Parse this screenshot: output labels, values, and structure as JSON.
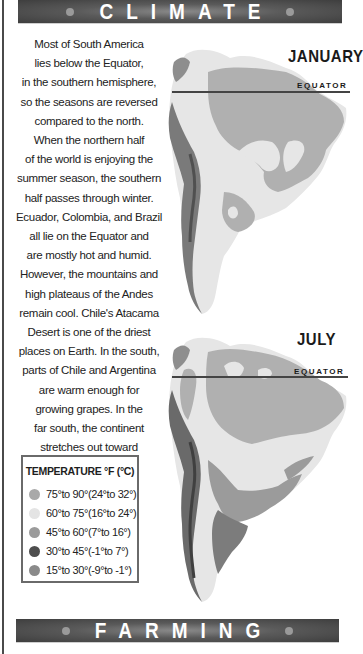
{
  "header": {
    "title": "CLIMATE"
  },
  "footer": {
    "title": "FARMING"
  },
  "body_text": {
    "lines": [
      "Most of South America",
      "lies below the Equator,",
      "in the southern hemisphere,",
      "so the seasons are reversed",
      "compared to the north.",
      "When the northern half",
      "of the world is enjoying the",
      "summer season, the southern",
      "half passes through winter.",
      "Ecuador, Colombia, and Brazil",
      "all lie on the Equator and",
      "are mostly hot and humid.",
      "However, the mountains and",
      "high plateaus of the Andes",
      "remain cool. Chile's Atacama",
      "Desert is one of the driest",
      "places on Earth. In the south,",
      "parts of Chile and Argentina",
      "are warm enough for",
      "growing grapes. In the",
      "far south, the continent",
      "stretches out toward",
      "Antarctica."
    ]
  },
  "legend": {
    "title": "TEMPERATURE °F (°C)",
    "items": [
      {
        "label": "75°to 90°(24°to 32°)",
        "color": "#a9a9a9"
      },
      {
        "label": "60°to 75°(16°to 24°)",
        "color": "#e4e4e4"
      },
      {
        "label": "45°to 60°(7°to 16°)",
        "color": "#9b9b9b"
      },
      {
        "label": "30°to 45°(-1°to 7°)",
        "color": "#4e4e4e"
      },
      {
        "label": "15°to 30°(-9°to -1°)",
        "color": "#8a8a8a"
      }
    ]
  },
  "maps": [
    {
      "month": "JANUARY",
      "equator_label": "EQUATOR"
    },
    {
      "month": "JULY",
      "equator_label": "EQUATOR"
    }
  ],
  "colors": {
    "hot": "#a9a9a9",
    "warm": "#e4e4e4",
    "mild": "#9b9b9b",
    "cold": "#4e4e4e",
    "cool": "#8a8a8a",
    "mountain": "#6e6e6e",
    "banner": "#4a4a4a"
  }
}
